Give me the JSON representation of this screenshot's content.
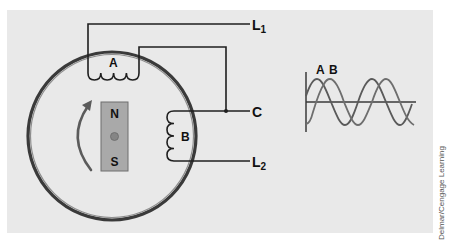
{
  "diagram": {
    "coils": [
      {
        "id": "A",
        "label": "A"
      },
      {
        "id": "B",
        "label": "B"
      }
    ],
    "terminals": [
      {
        "id": "L1",
        "main": "L",
        "sub": "1"
      },
      {
        "id": "C",
        "main": "C",
        "sub": ""
      },
      {
        "id": "L2",
        "main": "L",
        "sub": "2"
      }
    ],
    "rotor": {
      "north_label": "N",
      "south_label": "S",
      "rotation_arrow": "clockwise-arrow-icon"
    },
    "waveform": {
      "labels": [
        "A",
        "B"
      ],
      "description": "Two sine waves, B lagging A by ~90 degrees, ~2 cycles shown"
    },
    "colors": {
      "panel": "#e9e9e9",
      "rotor_fill": "#a9a9a9",
      "rotor_pivot": "#858585",
      "ring": "#3a3a3a",
      "wire": "#1f1f1f"
    }
  },
  "credit": "Delmar/Cengage Learning"
}
